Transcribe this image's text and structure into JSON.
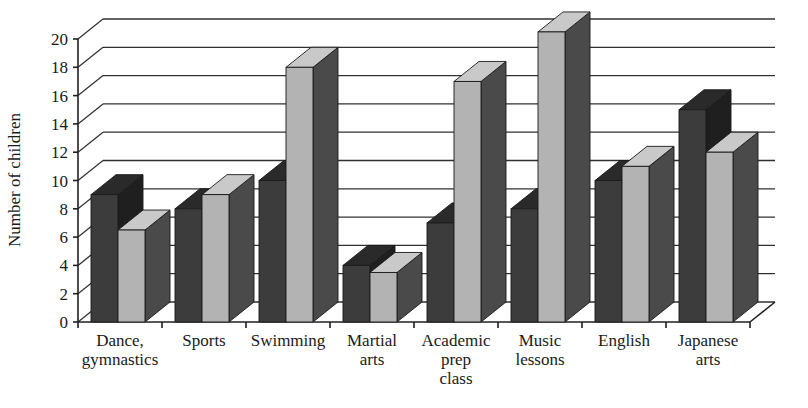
{
  "chart_data": {
    "type": "bar",
    "title": "",
    "subtitle": "",
    "xlabel": "",
    "ylabel": "Number of children",
    "ylim": [
      0,
      20
    ],
    "ytick_step": 2,
    "yticks": [
      "0",
      "2",
      "4",
      "6",
      "8",
      "10",
      "12",
      "14",
      "16",
      "18",
      "20"
    ],
    "grid": true,
    "legend": "none",
    "three_d": true,
    "categories": [
      "Dance,\ngymnastics",
      "Sports",
      "Swimming",
      "Martial\narts",
      "Academic\nprep\nclass",
      "Music\nlessons",
      "English",
      "Japanese\narts"
    ],
    "category_lines": [
      [
        "Dance,",
        "gymnastics"
      ],
      [
        "Sports"
      ],
      [
        "Swimming"
      ],
      [
        "Martial",
        "arts"
      ],
      [
        "Academic",
        "prep",
        "class"
      ],
      [
        "Music",
        "lessons"
      ],
      [
        "English"
      ],
      [
        "Japanese",
        "arts"
      ]
    ],
    "series": [
      {
        "name": "series-dark",
        "color": "#3c3c3c",
        "top_color": "#2a2a2a",
        "side_color": "#1f1f1f",
        "values": [
          9,
          8,
          10,
          4,
          7,
          8,
          10,
          15
        ]
      },
      {
        "name": "series-light",
        "color": "#b3b3b3",
        "top_color": "#c9c9c9",
        "side_color": "#4a4a4a",
        "values": [
          6.5,
          9,
          18,
          3.5,
          17,
          20.5,
          11,
          12
        ]
      }
    ]
  },
  "axis": {
    "y_title": "Number of children"
  },
  "caption": {
    "partial_text": ""
  },
  "colors": {
    "dark_series": "#3c3c3c",
    "light_series": "#b3b3b3",
    "gridline": "#303030",
    "axis": "#202020",
    "background": "#ffffff"
  }
}
